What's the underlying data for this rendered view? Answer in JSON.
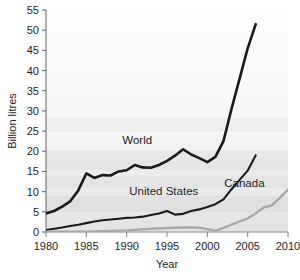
{
  "chart_data": {
    "type": "line",
    "title": "",
    "xlabel": "Year",
    "ylabel": "Billion litres",
    "xlim": [
      1980,
      2010
    ],
    "ylim": [
      0,
      55
    ],
    "xticks": [
      1980,
      1985,
      1990,
      1995,
      2000,
      2005,
      2010
    ],
    "yticks": [
      0,
      5,
      10,
      15,
      20,
      25,
      30,
      35,
      40,
      45,
      50,
      55
    ],
    "grid": false,
    "legend_position": "inline-labels",
    "series": [
      {
        "name": "World",
        "color": "#1a1a1a",
        "label_x": 1991.3,
        "label_y": 21.8,
        "x": [
          1980,
          1981,
          1982,
          1983,
          1984,
          1985,
          1986,
          1987,
          1988,
          1989,
          1990,
          1991,
          1992,
          1993,
          1994,
          1995,
          1996,
          1997,
          1998,
          1999,
          2000,
          2001,
          2002,
          2003,
          2004,
          2005,
          2006
        ],
        "y": [
          4.6,
          5.2,
          6.3,
          7.6,
          10.3,
          14.5,
          13.4,
          14.1,
          14.0,
          15.0,
          15.3,
          16.6,
          16.0,
          15.9,
          16.6,
          17.6,
          18.9,
          20.5,
          19.2,
          18.3,
          17.3,
          18.6,
          22.5,
          30.5,
          38.0,
          45.5,
          51.5
        ]
      },
      {
        "name": "United States",
        "color": "#1a1a1a",
        "label_x": 1994.6,
        "label_y": 9.1,
        "x": [
          1980,
          1981,
          1982,
          1983,
          1984,
          1985,
          1986,
          1987,
          1988,
          1989,
          1990,
          1991,
          1992,
          1993,
          1994,
          1995,
          1996,
          1997,
          1998,
          1999,
          2000,
          2001,
          2002,
          2003,
          2004,
          2005,
          2006
        ],
        "y": [
          0.5,
          0.8,
          1.1,
          1.5,
          1.8,
          2.2,
          2.6,
          2.9,
          3.1,
          3.3,
          3.5,
          3.6,
          3.8,
          4.2,
          4.6,
          5.2,
          4.3,
          4.5,
          5.2,
          5.6,
          6.2,
          6.9,
          8.1,
          10.6,
          12.9,
          15.2,
          19.0
        ]
      },
      {
        "name": "Canada",
        "color": "#a8a8a8",
        "label_x": 2004.6,
        "label_y": 11.2,
        "x": [
          1980,
          1985,
          1990,
          1993,
          1995,
          1997,
          1998,
          1999,
          2000,
          2001,
          2002,
          2003,
          2004,
          2005,
          2006,
          2007,
          2008,
          2009,
          2010
        ],
        "y": [
          0.05,
          0.1,
          0.4,
          0.8,
          1.0,
          1.1,
          1.15,
          1.05,
          0.7,
          0.3,
          1.0,
          1.8,
          2.6,
          3.4,
          4.6,
          6.1,
          6.6,
          8.5,
          10.5
        ]
      }
    ]
  },
  "axes": {
    "y_title": "Billion litres",
    "x_title": "Year",
    "y_tick_labels": [
      "0",
      "5",
      "10",
      "15",
      "20",
      "25",
      "30",
      "35",
      "40",
      "45",
      "50",
      "55"
    ],
    "x_tick_labels": [
      "1980",
      "1985",
      "1990",
      "1995",
      "2000",
      "2005",
      "2010"
    ]
  },
  "colors": {
    "world": "#1a1a1a",
    "united_states": "#1a1a1a",
    "canada": "#a8a8a8",
    "axis": "#6e6e6e",
    "plot_background_top": "#fdfdfd",
    "plot_background_bottom": "#e6e6e6",
    "page_background": "#ffffff"
  }
}
